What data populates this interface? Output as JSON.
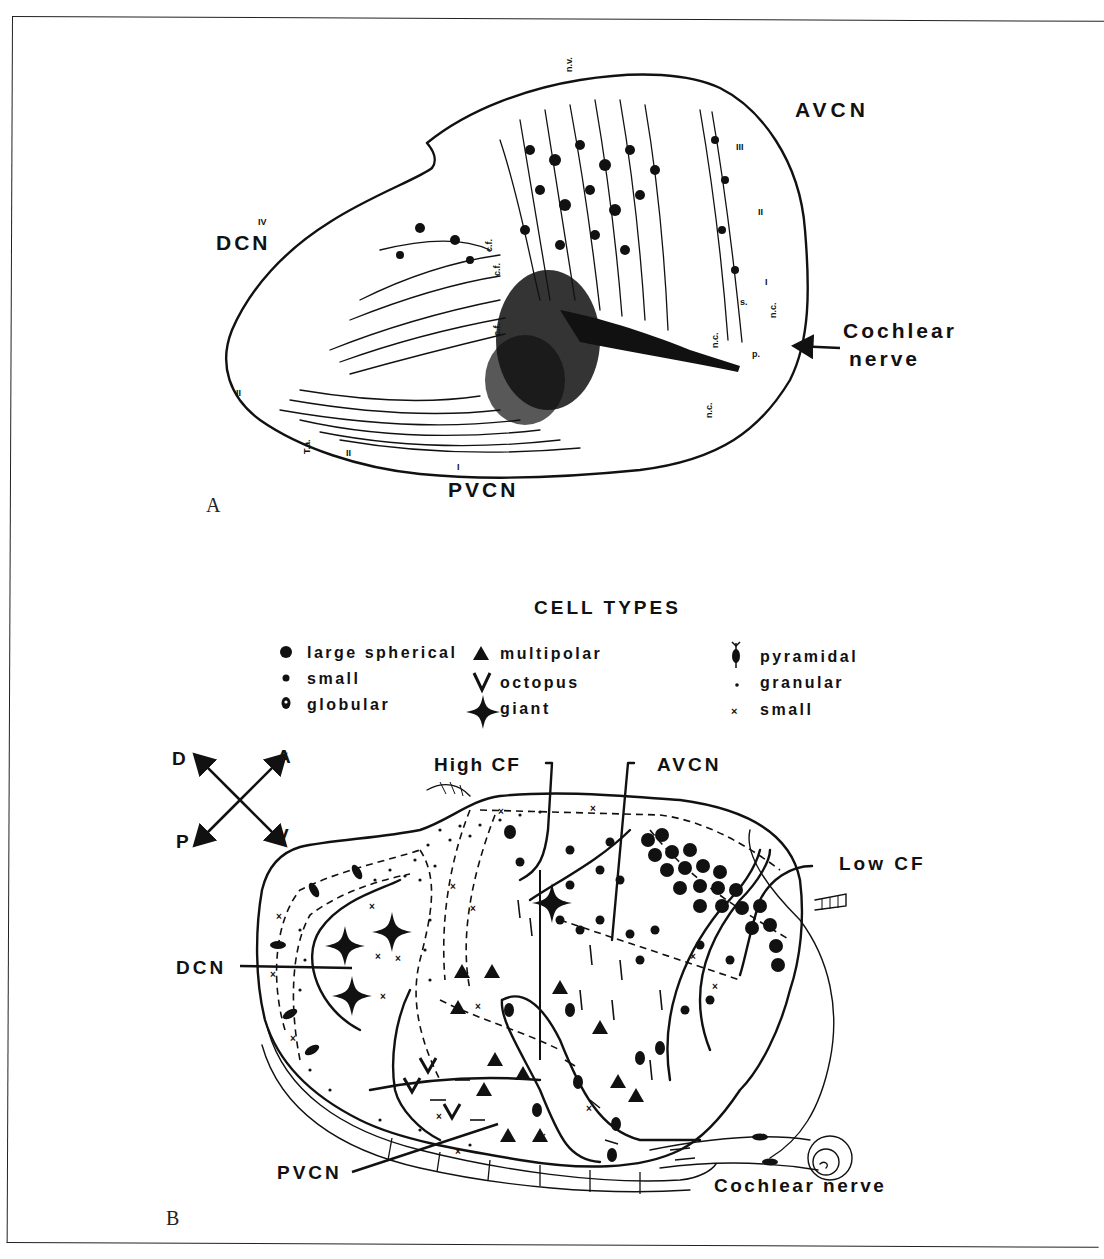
{
  "figure": {
    "panels": [
      {
        "id": "A",
        "letter": "A",
        "regions": {
          "avcn": "AVCN",
          "dcn": "DCN",
          "pvcn": "PVCN"
        },
        "nerve_label_line1": "Cochlear",
        "nerve_label_line2": "nerve",
        "small_annotations": {
          "top": "n.v.",
          "t_a": "T.a.",
          "c_f_1": "c.f.",
          "c_f_2": "c.f.",
          "c_f_3": "c.f.",
          "n_c_1": "n.c.",
          "n_c_2": "n.c.",
          "n_c_3": "n.c.",
          "p": "p.",
          "s": "s."
        },
        "layer_numerals": {
          "dcn_iv": "IV",
          "avcn_iii": "III",
          "avcn_ii": "II",
          "avcn_i": "I",
          "left_ii": "II",
          "bottom_ii": "II",
          "pvcn_i": "I"
        }
      },
      {
        "id": "B",
        "letter": "B",
        "legend": {
          "title": "CELL TYPES",
          "columns": [
            [
              {
                "symbol": "large-dot",
                "label": "large spherical"
              },
              {
                "symbol": "small-dot",
                "label": "small"
              },
              {
                "symbol": "ringed-dot",
                "label": "globular"
              }
            ],
            [
              {
                "symbol": "triangle",
                "label": "multipolar"
              },
              {
                "symbol": "v-shape",
                "label": "octopus"
              },
              {
                "symbol": "four-point-star",
                "label": "giant"
              }
            ],
            [
              {
                "symbol": "spindle",
                "label": "pyramidal"
              },
              {
                "symbol": "tiny-dot",
                "label": "granular"
              },
              {
                "symbol": "cross",
                "label": "small"
              }
            ]
          ]
        },
        "compass": {
          "d": "D",
          "a": "A",
          "p": "P",
          "v": "V"
        },
        "labels": {
          "high_cf": "High CF",
          "avcn": "AVCN",
          "low_cf": "Low CF",
          "dcn": "DCN",
          "pvcn": "PVCN",
          "cochlear_nerve": "Cochlear nerve"
        }
      }
    ],
    "colors": {
      "ink": "#111111",
      "paper": "#ffffff",
      "frame": "#222222"
    }
  }
}
